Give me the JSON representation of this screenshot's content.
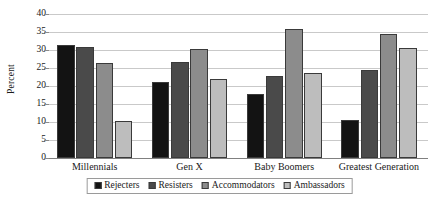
{
  "chart_data": {
    "type": "bar",
    "title": "",
    "subtitle": "",
    "xlabel": "",
    "ylabel": "Percent",
    "ylim": [
      0,
      40
    ],
    "ytick_step": 5,
    "yticks": [
      0,
      5,
      10,
      15,
      20,
      25,
      30,
      35,
      40
    ],
    "ytick_labels": [
      "0",
      "5",
      "10",
      "15",
      "20",
      "25",
      "30",
      "35",
      "40"
    ],
    "grid": true,
    "grid_axis": "y",
    "legend_position": "bottom",
    "categories": [
      "Millennials",
      "Gen X",
      "Baby Boomers",
      "Greatest Generation"
    ],
    "series": [
      {
        "name": "Rejecters",
        "color": "#131313",
        "values": [
          31.5,
          21.0,
          17.8,
          10.5
        ]
      },
      {
        "name": "Resisters",
        "color": "#4a4a4a",
        "values": [
          30.9,
          26.6,
          22.9,
          24.5
        ]
      },
      {
        "name": "Accommodators",
        "color": "#8c8c8c",
        "values": [
          26.5,
          30.2,
          35.9,
          34.5
        ]
      },
      {
        "name": "Ambassadors",
        "color": "#bdbdbd",
        "values": [
          10.4,
          22.0,
          23.7,
          30.6
        ]
      }
    ]
  }
}
